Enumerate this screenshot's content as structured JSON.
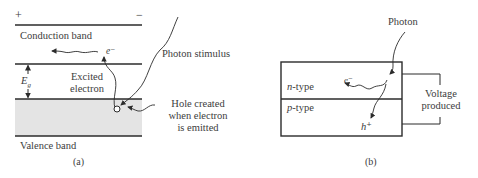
{
  "panel_a": {
    "plus_sign": "+",
    "minus_sign": "−",
    "conduction_band": "Conduction band",
    "electron_symbol": "e⁻",
    "photon_stimulus": "Photon stimulus",
    "energy_gap_symbol": "E",
    "energy_gap_subscript": "g",
    "excited_electron_line1": "Excited",
    "excited_electron_line2": "electron",
    "hole_line1": "Hole created",
    "hole_line2": "when electron",
    "hole_line3": "is emitted",
    "valence_band": "Valence band",
    "caption": "(a)"
  },
  "panel_b": {
    "photon": "Photon",
    "electron_symbol": "e⁻",
    "n_type_prefix": "n",
    "n_type_suffix": "-type",
    "p_type_prefix": "p",
    "p_type_suffix": "-type",
    "hole_symbol": "h⁺",
    "voltage_line1": "Voltage",
    "voltage_line2": "produced",
    "caption": "(b)"
  },
  "colors": {
    "line": "#2b2b2b",
    "valence_fill": "#e4e4e4",
    "text": "#3c3c3c"
  }
}
